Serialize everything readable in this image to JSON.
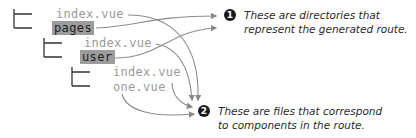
{
  "tree": {
    "root_file": "index.vue",
    "root_dir": "pages",
    "level2_file": "index.vue",
    "level2_dir": "user",
    "level3_file1": "index.vue",
    "level3_file2": "one.vue"
  },
  "annotations": [
    {
      "number": "1",
      "line1": "These are directories that",
      "line2": "represent the generated route."
    },
    {
      "number": "2",
      "line1": "These are files that correspond",
      "line2": "to components in the route."
    }
  ],
  "colors": {
    "file_text": "#9a9a9a",
    "dir_highlight": "#9c9c9c",
    "dir_text": "#1e1e1e",
    "tree_lines": "#333333",
    "arrows": "#8c8c8c",
    "badge": "#1a1a1a"
  }
}
